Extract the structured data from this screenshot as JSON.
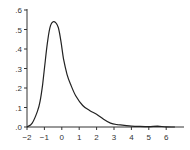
{
  "chart_data": {
    "type": "line",
    "title": "",
    "xlabel": "",
    "ylabel": "",
    "xlim": [
      -2,
      7
    ],
    "ylim": [
      0,
      0.6
    ],
    "grid": false,
    "legend": null,
    "x_ticks": [
      -2,
      -1,
      0,
      1,
      2,
      3,
      4,
      5,
      6
    ],
    "x_tick_labels": [
      "−2",
      "−1",
      "0",
      "1",
      "2",
      "3",
      "4",
      "5",
      "6"
    ],
    "y_ticks": [
      0,
      0.1,
      0.2,
      0.3,
      0.4,
      0.5,
      0.6
    ],
    "y_tick_labels": [
      ".0",
      ".1",
      ".2",
      ".3",
      ".4",
      ".5",
      ".6"
    ],
    "series": [
      {
        "name": "density",
        "color": "#222222",
        "x": [
          -2.0,
          -1.7,
          -1.4,
          -1.25,
          -1.1,
          -0.95,
          -0.8,
          -0.65,
          -0.5,
          -0.35,
          -0.2,
          -0.05,
          0.1,
          0.3,
          0.5,
          0.8,
          1.2,
          1.6,
          2.0,
          2.4,
          2.8,
          3.2,
          3.6,
          4.0,
          4.5,
          5.0,
          5.5,
          6.0,
          6.5
        ],
        "y": [
          0.0,
          0.02,
          0.08,
          0.13,
          0.22,
          0.34,
          0.45,
          0.52,
          0.54,
          0.535,
          0.51,
          0.44,
          0.35,
          0.27,
          0.22,
          0.16,
          0.11,
          0.085,
          0.065,
          0.04,
          0.02,
          0.012,
          0.008,
          0.004,
          0.003,
          0.002,
          0.004,
          0.001,
          0.0
        ]
      }
    ]
  },
  "axes": {
    "x_tick_labels": [
      "−2",
      "−1",
      "0",
      "1",
      "2",
      "3",
      "4",
      "5",
      "6"
    ],
    "y_tick_labels": [
      ".0",
      ".1",
      ".2",
      ".3",
      ".4",
      ".5",
      ".6"
    ]
  }
}
